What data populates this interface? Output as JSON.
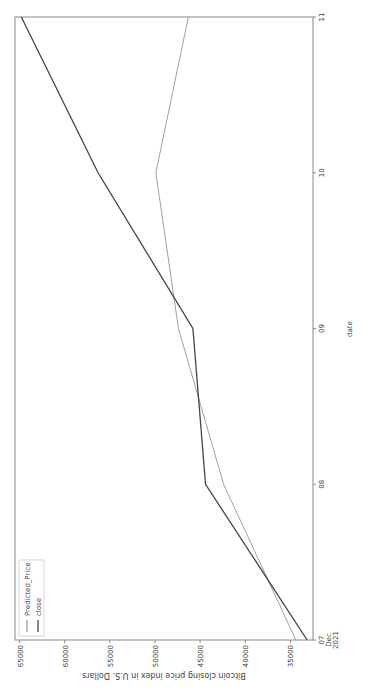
{
  "chart_data": {
    "type": "line",
    "title": "",
    "xlabel": "date",
    "ylabel": "Bitcoin closing price index in U.S. Dollars",
    "x": [
      "07\nDec\n2021",
      "08",
      "09",
      "10",
      "11"
    ],
    "x_tick_labels": [
      [
        "07",
        "Dec",
        "2021"
      ],
      [
        "08"
      ],
      [
        "09"
      ],
      [
        "10"
      ],
      [
        "11"
      ]
    ],
    "ylim": [
      32500,
      65500
    ],
    "y_ticks": [
      35000,
      40000,
      45000,
      50000,
      55000,
      60000,
      65000
    ],
    "grid": false,
    "legend_position": "top-left",
    "orientation": "rotated-90-ccw",
    "series": [
      {
        "name": "Predicted_Price",
        "color": "#a0a0a0",
        "values": [
          34400,
          42400,
          47400,
          49900,
          46300
        ]
      },
      {
        "name": "close",
        "color": "#444444",
        "values": [
          33150,
          44400,
          45800,
          56300,
          64800
        ]
      }
    ]
  }
}
